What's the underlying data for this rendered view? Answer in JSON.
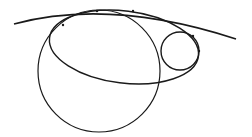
{
  "diagram": {
    "width": 252,
    "height": 137,
    "background": "#ffffff",
    "stroke_color": "#1a1a1a",
    "shapes": {
      "top_curve": {
        "start": [
          14,
          24
        ],
        "control": [
          110,
          -2
        ],
        "end": [
          236,
          39
        ],
        "stroke_width": 1.6
      },
      "large_circle": {
        "cx": 99,
        "cy": 71,
        "r": 61,
        "stroke_width": 1.2
      },
      "ellipse": {
        "cx": 124,
        "cy": 47,
        "rx": 75,
        "ry": 36,
        "rotate": 7,
        "stroke_width": 1.4
      },
      "small_circle": {
        "cx": 180,
        "cy": 51,
        "r": 19,
        "stroke_width": 1.4
      }
    },
    "tangent_points": [
      [
        97,
        11
      ],
      [
        133,
        11
      ],
      [
        63,
        25
      ],
      [
        193,
        36
      ],
      [
        199,
        51
      ]
    ]
  }
}
